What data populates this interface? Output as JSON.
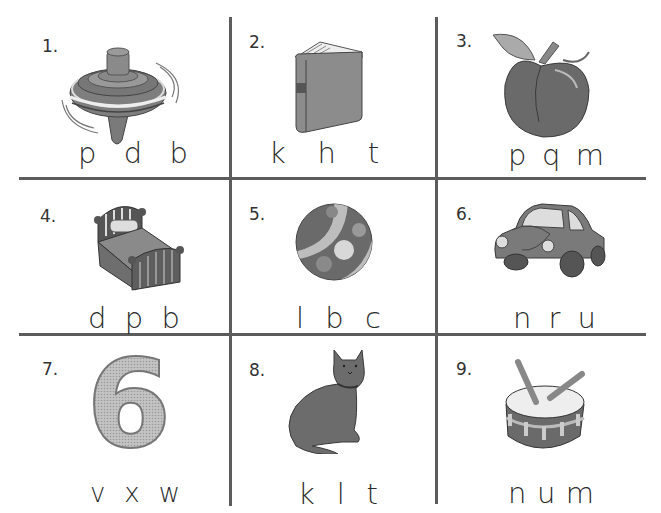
{
  "worksheet": {
    "items": [
      {
        "number": "1.",
        "picture": "spinning-top",
        "choices": [
          "p",
          "d",
          "b"
        ]
      },
      {
        "number": "2.",
        "picture": "book",
        "choices": [
          "k",
          "h",
          "t"
        ]
      },
      {
        "number": "3.",
        "picture": "peach",
        "choices": [
          "p",
          "q",
          "m"
        ]
      },
      {
        "number": "4.",
        "picture": "bed",
        "choices": [
          "d",
          "p",
          "b"
        ]
      },
      {
        "number": "5.",
        "picture": "ball",
        "choices": [
          "l",
          "b",
          "c"
        ]
      },
      {
        "number": "6.",
        "picture": "car",
        "choices": [
          "n",
          "r",
          "u"
        ]
      },
      {
        "number": "7.",
        "picture": "six",
        "glyph": "6",
        "choices": [
          "v",
          "x",
          "w"
        ]
      },
      {
        "number": "8.",
        "picture": "cat",
        "choices": [
          "k",
          "l",
          "t"
        ]
      },
      {
        "number": "9.",
        "picture": "drum",
        "choices": [
          "n",
          "u",
          "m"
        ]
      }
    ]
  },
  "colors": {
    "grid": "#5c5c5c",
    "fill_dark": "#6e6e6e",
    "fill_mid": "#8d8d8d",
    "fill_light": "#c9c9c9"
  }
}
